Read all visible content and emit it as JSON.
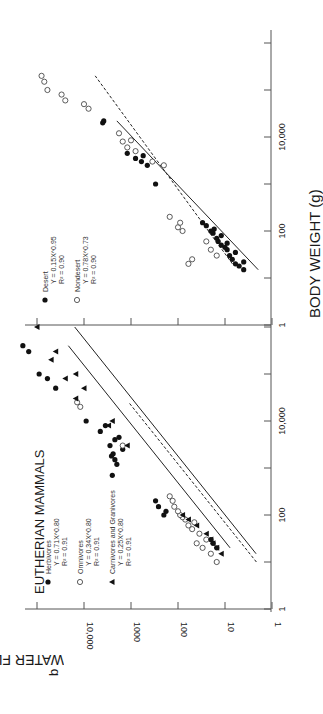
{
  "figure": {
    "panel_label": "b",
    "orientation": "rotated 90 degrees clockwise on page",
    "ylabel": "WATER FLUX (ml/day)",
    "xlabel": "BODY WEIGHT (g)"
  },
  "chart_data": [
    {
      "type": "scatter",
      "title": "EUTHERIAN MAMMALS",
      "xlabel": "BODY WEIGHT (g)",
      "ylabel": "WATER FLUX (ml/day)",
      "xscale": "log",
      "yscale": "log",
      "xlim": [
        1,
        1000000
      ],
      "ylim": [
        1,
        100000
      ],
      "x_tick_labels": [
        "1",
        "100",
        "10,000"
      ],
      "y_tick_labels": [
        "1",
        "10",
        "100",
        "1000",
        "10,000"
      ],
      "legend": [
        {
          "marker": "filled-circle",
          "label": "Herbivores",
          "equation": "Y = 0.71X^0.80",
          "r2": "R² = 0.91"
        },
        {
          "marker": "open-circle",
          "label": "Omnivores",
          "equation": "Y = 0.34X^0.80",
          "r2": "R² = 0.91"
        },
        {
          "marker": "filled-triangle",
          "label": "Carnivores and Granivores",
          "equation": "Y = 0.25X^0.80",
          "r2": "R² = 0.91"
        }
      ],
      "series": [
        {
          "name": "Herbivores",
          "marker": "filled-circle",
          "fit": {
            "a": 0.71,
            "b": 0.8,
            "style": "solid"
          },
          "points": [
            [
              20,
              15
            ],
            [
              25,
              18
            ],
            [
              30,
              20
            ],
            [
              100,
              200
            ],
            [
              120,
              180
            ],
            [
              150,
              260
            ],
            [
              200,
              300
            ],
            [
              700,
              2500
            ],
            [
              1200,
              2000
            ],
            [
              1500,
              2200
            ],
            [
              1800,
              2600
            ],
            [
              2000,
              2400
            ],
            [
              2500,
              1500
            ],
            [
              3000,
              2800
            ],
            [
              4000,
              2200
            ],
            [
              4500,
              1800
            ],
            [
              6000,
              4500
            ],
            [
              8000,
              3500
            ],
            [
              10000,
              9000
            ],
            [
              50000,
              40000
            ],
            [
              80000,
              60000
            ],
            [
              100000,
              90000
            ],
            [
              300000,
              150000
            ],
            [
              400000,
              200000
            ]
          ]
        },
        {
          "name": "Omnivores",
          "marker": "open-circle",
          "fit": {
            "a": 0.34,
            "b": 0.8,
            "style": "dashed"
          },
          "points": [
            [
              10,
              15
            ],
            [
              15,
              20
            ],
            [
              20,
              30
            ],
            [
              25,
              40
            ],
            [
              30,
              25
            ],
            [
              40,
              35
            ],
            [
              50,
              50
            ],
            [
              60,
              60
            ],
            [
              70,
              45
            ],
            [
              80,
              70
            ],
            [
              90,
              80
            ],
            [
              100,
              90
            ],
            [
              120,
              100
            ],
            [
              150,
              120
            ],
            [
              200,
              130
            ],
            [
              250,
              150
            ],
            [
              3000,
              1500
            ],
            [
              20000,
              12000
            ],
            [
              25000,
              14000
            ]
          ]
        },
        {
          "name": "Carnivores and Granivores",
          "marker": "filled-triangle",
          "fit": {
            "a": 0.25,
            "b": 0.8,
            "style": "solid"
          },
          "points": [
            [
              15,
              12
            ],
            [
              20,
              15
            ],
            [
              25,
              18
            ],
            [
              30,
              20
            ],
            [
              40,
              25
            ],
            [
              60,
              40
            ],
            [
              80,
              60
            ],
            [
              100,
              80
            ],
            [
              3000,
              1200
            ],
            [
              8000,
              3000
            ],
            [
              10000,
              2500
            ],
            [
              30000,
              15000
            ],
            [
              50000,
              10000
            ],
            [
              80000,
              25000
            ],
            [
              100000,
              15000
            ],
            [
              200000,
              50000
            ],
            [
              300000,
              40000
            ],
            [
              1000000,
              100000
            ]
          ]
        }
      ]
    },
    {
      "type": "scatter",
      "title": "",
      "xlabel": "BODY WEIGHT (g)",
      "ylabel": "WATER FLUX (ml/day)",
      "xscale": "log",
      "yscale": "log",
      "xlim": [
        1,
        1000000
      ],
      "ylim": [
        1,
        100000
      ],
      "x_tick_labels": [
        "1",
        "100",
        "10,000"
      ],
      "legend": [
        {
          "marker": "filled-circle",
          "label": "Desert",
          "equation": "Y = 0.15X^0.95",
          "r2": "R² = 0.90"
        },
        {
          "marker": "open-circle",
          "label": "Nondesert",
          "equation": "Y = 0.78X^0.73",
          "r2": "R² = 0.90"
        }
      ],
      "series": [
        {
          "name": "Desert",
          "marker": "filled-circle",
          "fit": {
            "a": 0.15,
            "b": 0.95,
            "style": "solid"
          },
          "points": [
            [
              15,
              4
            ],
            [
              18,
              5
            ],
            [
              20,
              6
            ],
            [
              22,
              4
            ],
            [
              25,
              7
            ],
            [
              30,
              8
            ],
            [
              35,
              6
            ],
            [
              40,
              9
            ],
            [
              45,
              10
            ],
            [
              50,
              12
            ],
            [
              55,
              9
            ],
            [
              60,
              14
            ],
            [
              70,
              15
            ],
            [
              80,
              12
            ],
            [
              90,
              18
            ],
            [
              100,
              20
            ],
            [
              110,
              17
            ],
            [
              130,
              25
            ],
            [
              150,
              30
            ],
            [
              1000,
              300
            ],
            [
              2500,
              450
            ],
            [
              3000,
              600
            ],
            [
              3500,
              800
            ],
            [
              4000,
              550
            ],
            [
              4500,
              1200
            ],
            [
              20000,
              4000
            ],
            [
              22000,
              3800
            ]
          ]
        },
        {
          "name": "Nondesert",
          "marker": "open-circle",
          "fit": {
            "a": 0.78,
            "b": 0.73,
            "style": "dashed"
          },
          "points": [
            [
              20,
              60
            ],
            [
              25,
              50
            ],
            [
              30,
              15
            ],
            [
              40,
              20
            ],
            [
              60,
              25
            ],
            [
              100,
              80
            ],
            [
              120,
              100
            ],
            [
              150,
              90
            ],
            [
              200,
              150
            ],
            [
              2500,
              200
            ],
            [
              3000,
              350
            ],
            [
              5000,
              800
            ],
            [
              6000,
              1200
            ],
            [
              8000,
              1500
            ],
            [
              8500,
              1000
            ],
            [
              12000,
              1800
            ],
            [
              40000,
              8000
            ],
            [
              50000,
              10000
            ],
            [
              60000,
              25000
            ],
            [
              80000,
              30000
            ],
            [
              100000,
              60000
            ],
            [
              150000,
              70000
            ],
            [
              200000,
              80000
            ]
          ]
        }
      ]
    }
  ]
}
